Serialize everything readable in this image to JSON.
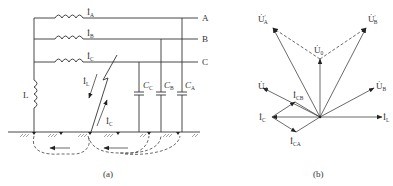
{
  "figure_a": {
    "caption": "(a)",
    "bus_labels": [
      "A",
      "B",
      "C"
    ],
    "phase_currents": [
      {
        "symbol": "İ",
        "sub": "A"
      },
      {
        "symbol": "İ",
        "sub": "B"
      },
      {
        "symbol": "İ",
        "sub": "C"
      }
    ],
    "inductor_label": "L",
    "fault_current_L": {
      "symbol": "İ",
      "sub": "L"
    },
    "fault_current_C": {
      "symbol": "İ",
      "sub": "C"
    },
    "capacitors": [
      {
        "symbol": "C",
        "sub": "C"
      },
      {
        "symbol": "C",
        "sub": "B"
      },
      {
        "symbol": "C",
        "sub": "A"
      }
    ]
  },
  "figure_b": {
    "caption": "(b)",
    "phasors": {
      "UA_prime": {
        "symbol": "U̇",
        "sub": "A",
        "sup": "′"
      },
      "UB_prime": {
        "symbol": "U̇",
        "sub": "B",
        "sup": "′"
      },
      "U0": {
        "symbol": "U̇",
        "sub": "0"
      },
      "UA": {
        "symbol": "U̇",
        "sub": "A"
      },
      "UB": {
        "symbol": "U̇",
        "sub": "B"
      },
      "ICB": {
        "symbol": "İ",
        "sub": "CB"
      },
      "IC": {
        "symbol": "İ",
        "sub": "C"
      },
      "ICA": {
        "symbol": "İ",
        "sub": "CA"
      },
      "IL": {
        "symbol": "İ",
        "sub": "L"
      }
    }
  }
}
